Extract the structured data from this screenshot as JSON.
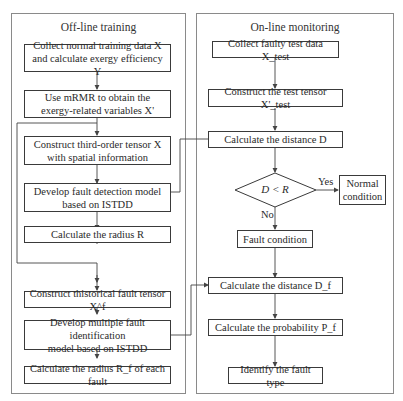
{
  "panels": {
    "offline": {
      "title": "Off-line training"
    },
    "online": {
      "title": "On-line monitoring"
    }
  },
  "offline_steps": [
    {
      "line1": "Collect normal training data X",
      "line2": "and calculate exergy efficiency Y"
    },
    {
      "line1": "Use mRMR to obtain the",
      "line2": "exergy-related variables X'"
    },
    {
      "line1": "Construct third-order tensor X",
      "line2": "with spatial information"
    },
    {
      "line1": "Develop fault detection model",
      "line2": "based on ISTDD"
    },
    {
      "line1": "Calculate the radius R"
    },
    {
      "line1": "Construct thistorical fault tensor X^f"
    },
    {
      "line1": "Develop multiple fault identification",
      "line2": "model based on ISTDD"
    },
    {
      "line1": "Calculate the radius R_f of each fault"
    }
  ],
  "online_steps": [
    {
      "line1": "Collect faulty test data X_test"
    },
    {
      "line1": "Construct the test tensor X'_test"
    },
    {
      "line1": "Calculate the distance D"
    },
    {
      "line1": "D < R"
    },
    {
      "line1": "Normal",
      "line2": "condition"
    },
    {
      "line1": "Fault condition"
    },
    {
      "line1": "Calculate the distance D_f"
    },
    {
      "line1": "Calculate the probability P_f"
    },
    {
      "line1": "Identify the fault type"
    }
  ],
  "decision_labels": {
    "yes": "Yes",
    "no": "No"
  },
  "colors": {
    "box_border": "#3a3a3a",
    "panel_border": "#8a8a8a",
    "line": "#444444"
  }
}
